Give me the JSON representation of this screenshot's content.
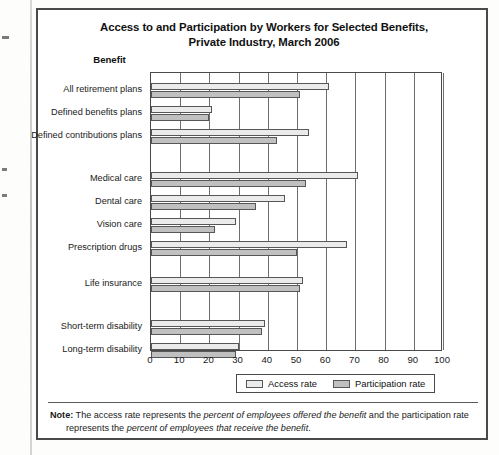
{
  "chart_data": {
    "type": "bar",
    "orientation": "horizontal",
    "title": "Access to and Participation by Workers for Selected Benefits, Private Industry, March 2006",
    "title_line1": "Access to and Participation by Workers for Selected Benefits,",
    "title_line2": "Private Industry, March 2006",
    "category_axis_title": "Benefit",
    "xlabel": "",
    "ylabel": "",
    "xlim": [
      0,
      100
    ],
    "xticks": [
      0,
      10,
      20,
      30,
      40,
      50,
      60,
      70,
      80,
      90,
      100
    ],
    "grid": true,
    "legend_position": "bottom",
    "categories": [
      "All retirement plans",
      "Defined benefits plans",
      "Defined contributions plans",
      "Medical care",
      "Dental care",
      "Vision care",
      "Prescription drugs",
      "Life insurance",
      "Short-term disability",
      "Long-term disability"
    ],
    "series": [
      {
        "name": "Access rate",
        "color": "#ebebeb",
        "values": [
          61,
          21,
          54,
          71,
          46,
          29,
          67,
          52,
          39,
          30
        ]
      },
      {
        "name": "Participation rate",
        "color": "#c0c0c0",
        "values": [
          51,
          20,
          43,
          53,
          36,
          22,
          50,
          51,
          38,
          29
        ]
      }
    ]
  },
  "note": {
    "label": "Note:",
    "text_1": " The access rate represents the ",
    "em_1": "percent of employees offered the benefit",
    "text_2": " and the participation rate",
    "text_3": "represents the ",
    "em_2": "percent of employees that receive the benefit",
    "text_4": "."
  }
}
